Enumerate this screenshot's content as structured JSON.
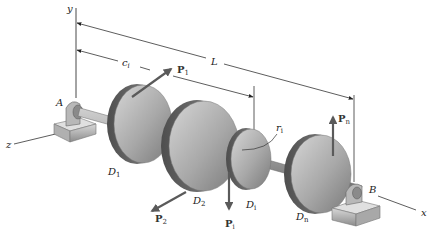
{
  "figure": {
    "axes": {
      "x_label": "x",
      "y_label": "y",
      "z_label": "z"
    },
    "supports": [
      {
        "id": "A",
        "label": "A"
      },
      {
        "id": "B",
        "label": "B"
      }
    ],
    "dimensions": {
      "total_length": {
        "label": "L"
      },
      "disk_position": {
        "label": "c",
        "subscript": "i"
      },
      "disk_radius": {
        "label": "r",
        "subscript": "i"
      }
    },
    "disks": [
      {
        "label": "D",
        "subscript": "1"
      },
      {
        "label": "D",
        "subscript": "2"
      },
      {
        "label": "D",
        "subscript": "i"
      },
      {
        "label": "D",
        "subscript": "n"
      }
    ],
    "forces": [
      {
        "label": "P",
        "subscript": "1",
        "direction": "up-right along tangent"
      },
      {
        "label": "P",
        "subscript": "2",
        "direction": "down-left"
      },
      {
        "label": "P",
        "subscript": "i",
        "direction": "down"
      },
      {
        "label": "P",
        "subscript": "n",
        "direction": "up"
      }
    ],
    "colors": {
      "disk_face": "#a9a9a9",
      "disk_rim": "#6e6e6e",
      "shaft": "#9a9a9a",
      "arrow": "#5a5a5a",
      "line": "#333333"
    }
  }
}
